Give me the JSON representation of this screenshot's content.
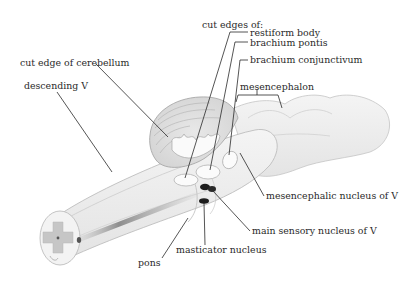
{
  "diagram": {
    "labels": {
      "cut_edges_of": "cut edges of:",
      "restiform_body": "restiform body",
      "brachium_pontis": "brachium pontis",
      "brachium_conjunctivum": "brachium conjunctivum",
      "cut_edge_of_cerebellum": "cut edge of cerebellum",
      "mesencephalon": "mesencephalon",
      "descending_v": "descending V",
      "mesencephalic_nucleus_of_v": "mesencephalic nucleus of V",
      "main_sensory_nucleus_of_v": "main sensory nucleus of V",
      "masticator_nucleus": "masticator nucleus",
      "pons": "pons"
    },
    "colors": {
      "background": "#ffffff",
      "tissue_fill": "#efefef",
      "tissue_stroke": "#b8b8b8",
      "gray_matter": "#c6c6c6",
      "nucleus_dark": "#1e1e1e",
      "leader_line": "#2a2a2a",
      "text": "#2a2a2a"
    }
  }
}
